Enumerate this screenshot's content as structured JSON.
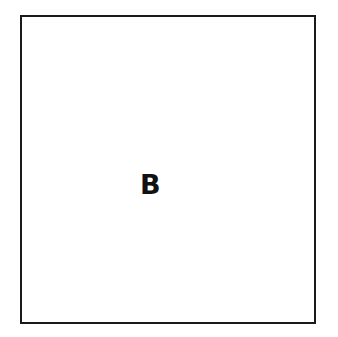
{
  "diagram": {
    "shape": "square",
    "label": "B",
    "colors": {
      "stroke": "#1a1a1a",
      "background": "#ffffff",
      "text": "#111111"
    }
  }
}
